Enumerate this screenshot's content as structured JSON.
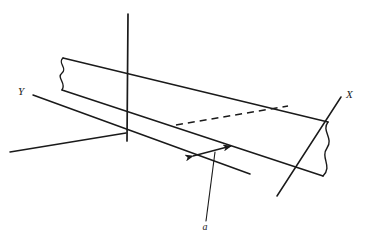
{
  "figure": {
    "background_color": "#ffffff",
    "stroke_color": "#1a1a1a",
    "labels": {
      "x_axis": "X",
      "y_axis": "Y",
      "vector": "a"
    },
    "geometry": {
      "origin": [
        126,
        133
      ],
      "z_axis": {
        "top": [
          128,
          14
        ],
        "bottom": [
          127,
          140
        ]
      },
      "x_axis": {
        "positive_end": [
          341,
          97
        ],
        "negative_end": [
          277,
          196
        ]
      },
      "y_axis": {
        "positive_end": [
          33,
          95
        ],
        "negative_end": [
          10,
          152
        ]
      },
      "plane_top_edge": {
        "from": [
          63,
          58
        ],
        "to": [
          328,
          122
        ]
      },
      "plane_bottom_edge": {
        "from": [
          62,
          90
        ],
        "to": [
          323,
          176
        ]
      },
      "plane_left_wave": {
        "from": [
          63,
          58
        ],
        "to": [
          62,
          90
        ]
      },
      "plane_right_wave": {
        "from": [
          328,
          122
        ],
        "to": [
          323,
          176
        ]
      },
      "hidden_dashed_segment": {
        "from": [
          176,
          125
        ],
        "to": [
          288,
          106
        ]
      },
      "vector_arrow": {
        "tail": [
          192,
          156
        ],
        "head": [
          232,
          146
        ]
      },
      "leader_line": {
        "from": [
          206,
          222
        ],
        "to": [
          215,
          152
        ]
      }
    },
    "label_positions": {
      "x_axis": [
        346,
        98
      ],
      "y_axis": [
        20,
        95
      ],
      "vector": [
        205,
        229
      ]
    },
    "styles": {
      "solid_stroke_width": 1.5,
      "thin_stroke_width": 1.1,
      "dash_pattern": "7,5"
    }
  }
}
